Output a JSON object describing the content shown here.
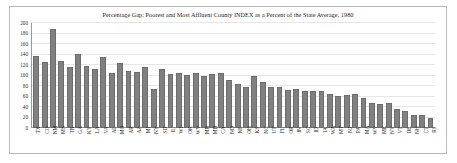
{
  "chart_data": {
    "type": "bar",
    "title": "Percentage Gap: Poorest and Most Affluent County INDEX as a Percent of the State Average, 1980",
    "xlabel": "",
    "ylabel": "",
    "ylim": [
      0,
      200
    ],
    "yticks": [
      200,
      180,
      160,
      140,
      120,
      100,
      80,
      60,
      40,
      20,
      0
    ],
    "grid": true,
    "legend": "none",
    "bar_color": "#808080",
    "frame_color": "#b9b9b9",
    "categories": [
      "TX",
      "CO",
      "NM",
      "MS",
      "TN",
      "GA",
      "KY",
      "LA",
      "VA",
      "AL",
      "MO",
      "AR",
      "AZ",
      "MI",
      "NY",
      "SD",
      "IL",
      "WI",
      "OK",
      "WV",
      "MN",
      "MD",
      "CA",
      "ND",
      "NE",
      "OH",
      "KS",
      "NC",
      "UT",
      "FL",
      "OR",
      "IN",
      "SC",
      "ID",
      "IA",
      "WA",
      "MT",
      "NJ",
      "PA",
      "MA",
      "WV",
      "ME",
      "NV",
      "VT",
      "DE",
      "NH",
      "CT",
      "RI"
    ],
    "values": [
      138,
      126,
      188,
      127,
      116,
      141,
      118,
      113,
      136,
      105,
      124,
      108,
      106,
      117,
      74,
      112,
      102,
      104,
      101,
      105,
      99,
      102,
      104,
      91,
      84,
      78,
      100,
      87,
      78,
      78,
      73,
      75,
      71,
      71,
      70,
      64,
      61,
      62,
      64,
      57,
      47,
      45,
      48,
      36,
      32,
      25,
      24,
      19
    ]
  }
}
